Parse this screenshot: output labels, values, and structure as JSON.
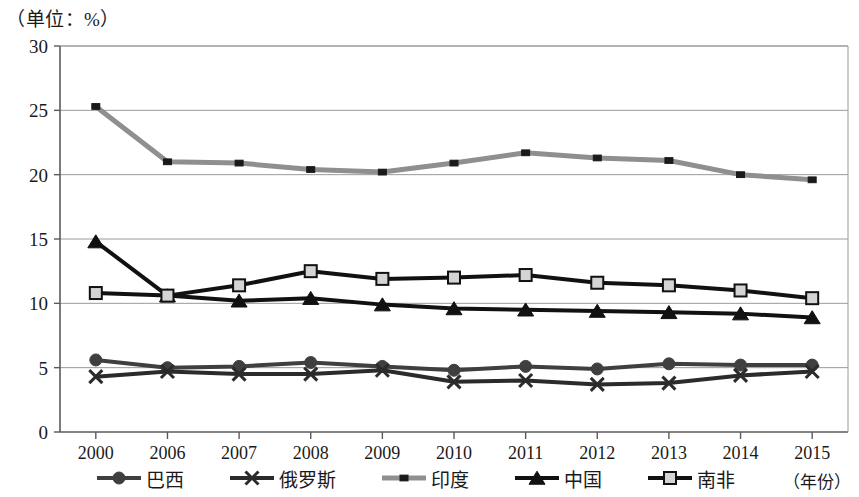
{
  "chart_data": {
    "type": "line",
    "title": "",
    "unit_label": "（单位：%）",
    "xlabel": "（年份）",
    "ylabel": "",
    "categories": [
      "2000",
      "2006",
      "2007",
      "2008",
      "2009",
      "2010",
      "2011",
      "2012",
      "2013",
      "2014",
      "2015"
    ],
    "ylim": [
      0,
      30
    ],
    "yticks": [
      0,
      5,
      10,
      15,
      20,
      25,
      30
    ],
    "ytick_labels": [
      "0",
      "5",
      "10",
      "15",
      "20",
      "25",
      "30"
    ],
    "grid": true,
    "legend_position": "bottom",
    "series": [
      {
        "name": "巴西",
        "marker": "circle",
        "color": "#3f3f3f",
        "values": [
          5.6,
          5.0,
          5.1,
          5.4,
          5.1,
          4.8,
          5.1,
          4.9,
          5.3,
          5.2,
          5.2
        ]
      },
      {
        "name": "俄罗斯",
        "marker": "x",
        "color": "#2b2b2b",
        "values": [
          4.3,
          4.7,
          4.5,
          4.5,
          4.8,
          3.9,
          4.0,
          3.7,
          3.8,
          4.4,
          4.7
        ]
      },
      {
        "name": "印度",
        "marker": "small-square",
        "color": "#8f8f8f",
        "values": [
          25.3,
          21.0,
          20.9,
          20.4,
          20.2,
          20.9,
          21.7,
          21.3,
          21.1,
          20.0,
          19.6
        ]
      },
      {
        "name": "中国",
        "marker": "triangle",
        "color": "#111111",
        "values": [
          14.8,
          10.6,
          10.2,
          10.4,
          9.9,
          9.6,
          9.5,
          9.4,
          9.3,
          9.2,
          8.9
        ]
      },
      {
        "name": "南非",
        "marker": "open-square",
        "color": "#111111",
        "values": [
          10.8,
          10.6,
          11.4,
          12.5,
          11.9,
          12.0,
          12.2,
          11.6,
          11.4,
          11.0,
          10.4
        ]
      }
    ]
  }
}
